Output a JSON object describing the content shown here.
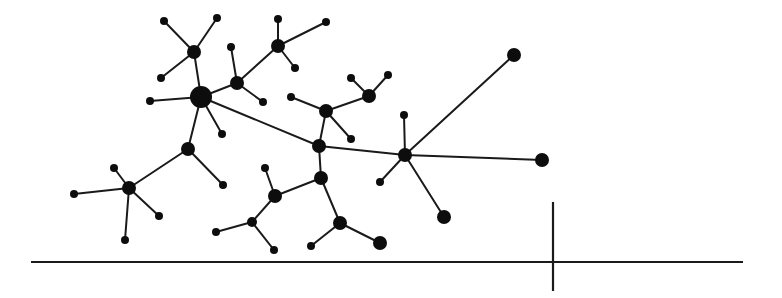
{
  "diagram": {
    "type": "network-graph",
    "colors": {
      "node": "#0d0d0d",
      "edge": "#1a1a1a",
      "background": "#ffffff"
    },
    "nodes": [
      {
        "id": "A",
        "x": 201,
        "y": 97,
        "r": 11,
        "role": "hub"
      },
      {
        "id": "B",
        "x": 194,
        "y": 52,
        "r": 7,
        "role": "hub"
      },
      {
        "id": "B1",
        "x": 164,
        "y": 21,
        "r": 4
      },
      {
        "id": "B2",
        "x": 217,
        "y": 18,
        "r": 4
      },
      {
        "id": "B3",
        "x": 161,
        "y": 78,
        "r": 4
      },
      {
        "id": "A1",
        "x": 150,
        "y": 101,
        "r": 4
      },
      {
        "id": "A2",
        "x": 222,
        "y": 134,
        "r": 4
      },
      {
        "id": "C",
        "x": 237,
        "y": 83,
        "r": 7,
        "role": "hub"
      },
      {
        "id": "C1",
        "x": 231,
        "y": 47,
        "r": 4
      },
      {
        "id": "C2",
        "x": 263,
        "y": 102,
        "r": 4
      },
      {
        "id": "D",
        "x": 278,
        "y": 46,
        "r": 7,
        "role": "hub"
      },
      {
        "id": "D1",
        "x": 278,
        "y": 19,
        "r": 4
      },
      {
        "id": "D2",
        "x": 326,
        "y": 22,
        "r": 4
      },
      {
        "id": "D3",
        "x": 295,
        "y": 68,
        "r": 4
      },
      {
        "id": "E",
        "x": 188,
        "y": 149,
        "r": 7,
        "role": "hub"
      },
      {
        "id": "E1",
        "x": 223,
        "y": 185,
        "r": 4
      },
      {
        "id": "F",
        "x": 129,
        "y": 188,
        "r": 7,
        "role": "hub"
      },
      {
        "id": "F1",
        "x": 114,
        "y": 168,
        "r": 4
      },
      {
        "id": "F2",
        "x": 74,
        "y": 194,
        "r": 4
      },
      {
        "id": "F3",
        "x": 159,
        "y": 216,
        "r": 4
      },
      {
        "id": "F4",
        "x": 125,
        "y": 240,
        "r": 4
      },
      {
        "id": "G",
        "x": 326,
        "y": 111,
        "r": 7,
        "role": "hub"
      },
      {
        "id": "G1",
        "x": 291,
        "y": 97,
        "r": 4
      },
      {
        "id": "G2",
        "x": 351,
        "y": 139,
        "r": 4
      },
      {
        "id": "H",
        "x": 369,
        "y": 96,
        "r": 7,
        "role": "hub"
      },
      {
        "id": "H1",
        "x": 351,
        "y": 78,
        "r": 4
      },
      {
        "id": "H2",
        "x": 388,
        "y": 75,
        "r": 4
      },
      {
        "id": "I",
        "x": 319,
        "y": 146,
        "r": 7,
        "role": "hub"
      },
      {
        "id": "J",
        "x": 405,
        "y": 155,
        "r": 7,
        "role": "hub"
      },
      {
        "id": "J1",
        "x": 404,
        "y": 115,
        "r": 4
      },
      {
        "id": "J2",
        "x": 380,
        "y": 182,
        "r": 4
      },
      {
        "id": "J3",
        "x": 514,
        "y": 55,
        "r": 7
      },
      {
        "id": "J4",
        "x": 542,
        "y": 160,
        "r": 7
      },
      {
        "id": "J5",
        "x": 444,
        "y": 217,
        "r": 7
      },
      {
        "id": "K",
        "x": 321,
        "y": 178,
        "r": 7,
        "role": "hub"
      },
      {
        "id": "L",
        "x": 275,
        "y": 196,
        "r": 7,
        "role": "hub"
      },
      {
        "id": "L1",
        "x": 265,
        "y": 168,
        "r": 4
      },
      {
        "id": "M",
        "x": 252,
        "y": 222,
        "r": 5
      },
      {
        "id": "M1",
        "x": 216,
        "y": 232,
        "r": 4
      },
      {
        "id": "M2",
        "x": 274,
        "y": 250,
        "r": 4
      },
      {
        "id": "N",
        "x": 340,
        "y": 223,
        "r": 7,
        "role": "hub"
      },
      {
        "id": "N1",
        "x": 311,
        "y": 246,
        "r": 4
      },
      {
        "id": "N2",
        "x": 380,
        "y": 243,
        "r": 7
      }
    ],
    "edges": [
      [
        "A",
        "B"
      ],
      [
        "B",
        "B1"
      ],
      [
        "B",
        "B2"
      ],
      [
        "B",
        "B3"
      ],
      [
        "A",
        "A1"
      ],
      [
        "A",
        "A2"
      ],
      [
        "A",
        "C"
      ],
      [
        "A",
        "E"
      ],
      [
        "A",
        "I"
      ],
      [
        "C",
        "C1"
      ],
      [
        "C",
        "C2"
      ],
      [
        "C",
        "D"
      ],
      [
        "D",
        "D1"
      ],
      [
        "D",
        "D2"
      ],
      [
        "D",
        "D3"
      ],
      [
        "E",
        "E1"
      ],
      [
        "E",
        "F"
      ],
      [
        "F",
        "F1"
      ],
      [
        "F",
        "F2"
      ],
      [
        "F",
        "F3"
      ],
      [
        "F",
        "F4"
      ],
      [
        "G",
        "G1"
      ],
      [
        "G",
        "G2"
      ],
      [
        "G",
        "H"
      ],
      [
        "G",
        "I"
      ],
      [
        "H",
        "H1"
      ],
      [
        "H",
        "H2"
      ],
      [
        "I",
        "J"
      ],
      [
        "I",
        "K"
      ],
      [
        "J",
        "J1"
      ],
      [
        "J",
        "J2"
      ],
      [
        "J",
        "J3"
      ],
      [
        "J",
        "J4"
      ],
      [
        "J",
        "J5"
      ],
      [
        "K",
        "L"
      ],
      [
        "K",
        "N"
      ],
      [
        "L",
        "L1"
      ],
      [
        "L",
        "M"
      ],
      [
        "M",
        "M1"
      ],
      [
        "M",
        "M2"
      ],
      [
        "N",
        "N1"
      ],
      [
        "N",
        "N2"
      ]
    ],
    "axis": {
      "horizontal": {
        "x1": 31,
        "y1": 262,
        "x2": 743,
        "y2": 262
      },
      "vertical": {
        "x1": 553,
        "y1": 202,
        "x2": 553,
        "y2": 291
      }
    }
  }
}
